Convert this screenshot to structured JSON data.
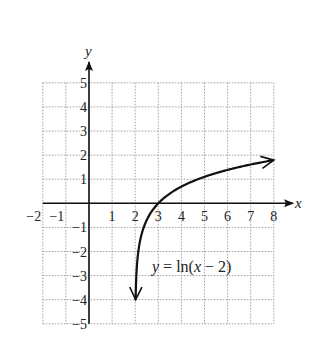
{
  "chart_data": {
    "type": "line",
    "title": "",
    "xlabel": "x",
    "ylabel": "y",
    "xlim": [
      -2,
      8
    ],
    "ylim": [
      -5,
      5
    ],
    "grid": true,
    "grid_style": "dotted",
    "x_ticks": [
      "−2",
      "−1",
      "1",
      "2",
      "3",
      "4",
      "5",
      "6",
      "7",
      "8"
    ],
    "y_ticks": [
      "5",
      "4",
      "3",
      "2",
      "1",
      "−1",
      "−2",
      "−3",
      "−4",
      "−5"
    ],
    "series": [
      {
        "name": "y = ln(x − 2)",
        "function": "ln(x - 2)",
        "x": [
          2.018,
          2.05,
          2.1,
          2.25,
          2.5,
          3,
          4,
          5,
          6,
          7,
          8
        ],
        "y": [
          -4.0,
          -3.0,
          -2.3,
          -1.39,
          -0.69,
          0,
          0.69,
          1.1,
          1.39,
          1.61,
          1.79
        ],
        "arrows": [
          "start",
          "end"
        ]
      }
    ],
    "annotations": [
      {
        "text": "y = ln(x − 2)",
        "x": 5.3,
        "y": -2.6
      }
    ],
    "legend": "none"
  },
  "labels": {
    "x_axis": "x",
    "y_axis": "y",
    "equation": "y = ln(x − 2)"
  }
}
